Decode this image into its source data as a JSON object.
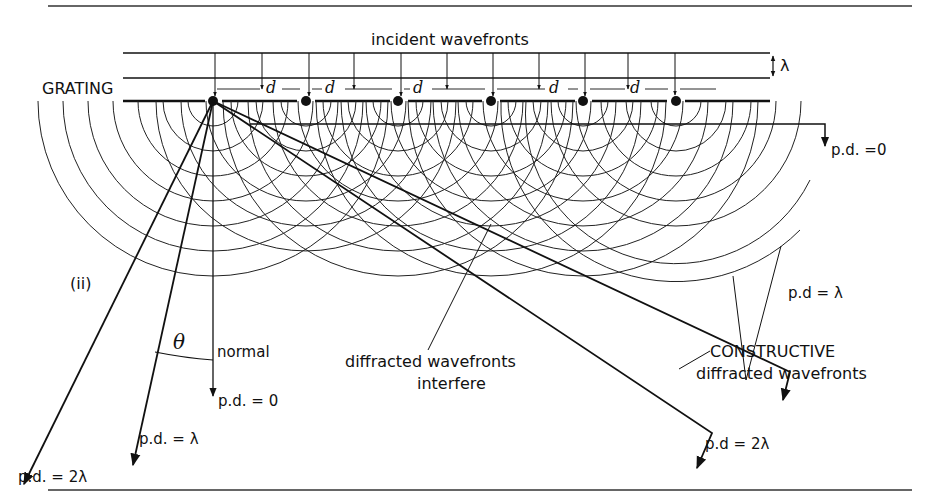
{
  "figure": {
    "title_label": "incident wavefronts",
    "grating_label": "GRATING",
    "wavelength_symbol": "λ",
    "slit_spacing_symbol": "d",
    "panel_label": "(ii)",
    "angle_symbol": "θ",
    "normal_label": "normal",
    "interfere_label_line1": "diffracted wavefronts",
    "interfere_label_line2": "interfere",
    "constructive_label_line1": "CONSTRUCTIVE",
    "constructive_label_line2": "diffracted wavefronts",
    "left_rays": [
      {
        "label": "p.d. = 0"
      },
      {
        "label": "p.d. = λ"
      },
      {
        "label": "p.d. = 2λ"
      }
    ],
    "right_rays": [
      {
        "label": "p.d. =0"
      },
      {
        "label": "p.d = λ"
      },
      {
        "label": "p.d = 2λ"
      }
    ],
    "slit_count": 6,
    "d_labels": [
      "d",
      "d",
      "d",
      "d",
      "d"
    ]
  }
}
